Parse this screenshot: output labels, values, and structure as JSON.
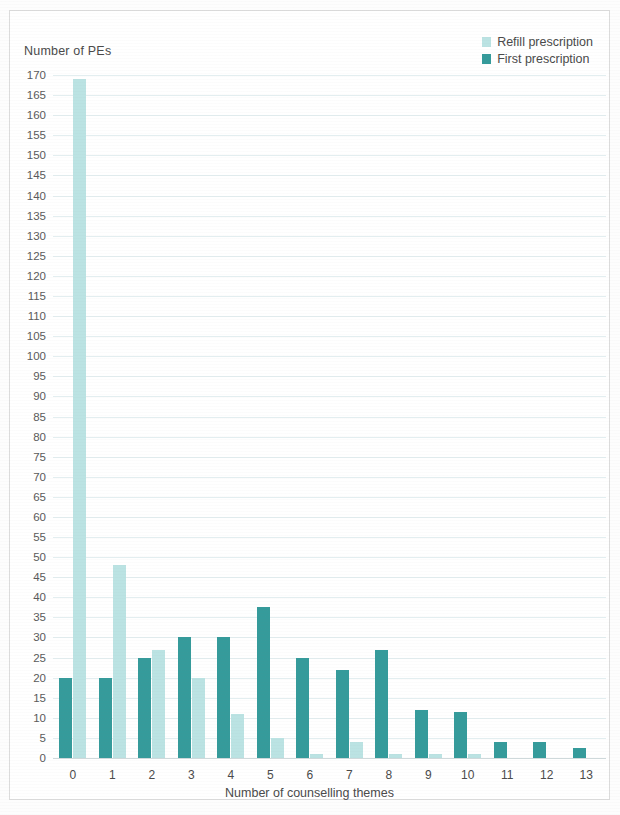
{
  "chart_data": {
    "type": "bar",
    "title": "",
    "ylabel": "Number of PEs",
    "xlabel": "Number of counselling themes",
    "categories": [
      "0",
      "1",
      "2",
      "3",
      "4",
      "5",
      "6",
      "7",
      "8",
      "9",
      "10",
      "11",
      "12",
      "13"
    ],
    "series": [
      {
        "name": "Refill prescription",
        "color": "#bbe3e3",
        "values": [
          169,
          48,
          27,
          20,
          11,
          5,
          1,
          4,
          1,
          1,
          1,
          0,
          0,
          0
        ]
      },
      {
        "name": "First prescription",
        "color": "#359b9b",
        "values": [
          20,
          20,
          25,
          30,
          30,
          37.5,
          25,
          22,
          27,
          12,
          11.5,
          4,
          4,
          2.5
        ]
      }
    ],
    "ylim": [
      0,
      170
    ],
    "ytick_step": 5,
    "yticks": [
      170,
      165,
      160,
      155,
      150,
      145,
      140,
      135,
      130,
      125,
      120,
      115,
      110,
      105,
      100,
      95,
      90,
      85,
      80,
      75,
      70,
      65,
      60,
      55,
      50,
      45,
      40,
      35,
      30,
      25,
      20,
      15,
      10,
      5,
      0
    ],
    "grid": true,
    "legend_position": "top-right",
    "bar_order_in_group": [
      "First prescription",
      "Refill prescription"
    ]
  },
  "legend": {
    "items": [
      {
        "label": "Refill prescription",
        "swatch": "#bbe3e3"
      },
      {
        "label": "First prescription",
        "swatch": "#359b9b"
      }
    ]
  }
}
